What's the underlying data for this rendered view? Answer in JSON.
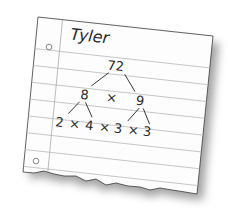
{
  "illustration": {
    "subject": "factor tree on torn notebook paper",
    "student_name": "Tyler",
    "colors": {
      "paper": "#ffffff",
      "rule_line": "#b8b8b8",
      "ink": "#2a2a2a",
      "shadow": "#555555"
    },
    "factor_tree": {
      "root": "72",
      "level1": {
        "left": "8",
        "operator": "×",
        "right": "9"
      },
      "level2": [
        {
          "text": "2"
        },
        {
          "text": "×"
        },
        {
          "text": "4"
        },
        {
          "text": "×"
        },
        {
          "text": "3"
        },
        {
          "text": "×"
        },
        {
          "text": "3"
        }
      ]
    },
    "icons": [
      "binder-hole-icon",
      "binder-hole-icon"
    ]
  }
}
